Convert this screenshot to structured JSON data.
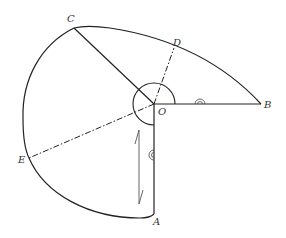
{
  "diagram": {
    "labels": {
      "A": "A",
      "B": "B",
      "C": "C",
      "D": "D",
      "E": "E",
      "O": "O"
    },
    "points": {
      "O": [
        154,
        104
      ],
      "A": [
        154,
        214
      ],
      "B": [
        261,
        104
      ],
      "C": [
        74,
        28
      ],
      "D": [
        174,
        48
      ],
      "E": [
        29,
        158
      ]
    },
    "colors": {
      "stroke": "#222222",
      "background": "#ffffff",
      "arrow": "#555555"
    }
  }
}
